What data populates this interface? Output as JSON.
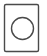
{
  "icon": {
    "name": "circle-in-rectangle-icon",
    "stroke_color": "#4a4a4a",
    "background_color": "#ffffff"
  }
}
